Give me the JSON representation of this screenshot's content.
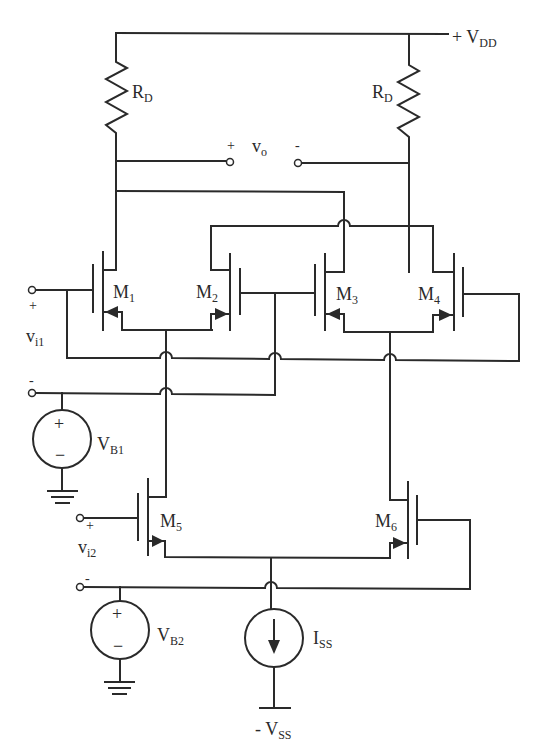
{
  "diagram": {
    "supply": {
      "vdd": {
        "sign": "+",
        "name": "V",
        "sub": "DD"
      },
      "vss": {
        "sign": "-",
        "name": "V",
        "sub": "SS"
      }
    },
    "resistors": [
      {
        "id": "rd-left",
        "name": "R",
        "sub": "D"
      },
      {
        "id": "rd-right",
        "name": "R",
        "sub": "D"
      }
    ],
    "output": {
      "plus": "+",
      "name": "v",
      "sub": "o",
      "minus": "-"
    },
    "transistors": [
      {
        "id": "m1",
        "name": "M",
        "sub": "1"
      },
      {
        "id": "m2",
        "name": "M",
        "sub": "2"
      },
      {
        "id": "m3",
        "name": "M",
        "sub": "3"
      },
      {
        "id": "m4",
        "name": "M",
        "sub": "4"
      },
      {
        "id": "m5",
        "name": "M",
        "sub": "5"
      },
      {
        "id": "m6",
        "name": "M",
        "sub": "6"
      }
    ],
    "inputs": {
      "vi1": {
        "plus": "+",
        "name": "v",
        "sub": "i1",
        "minus": "-"
      },
      "vi2": {
        "plus": "+",
        "name": "v",
        "sub": "i2",
        "minus": "-"
      }
    },
    "sources": {
      "vb1": {
        "name": "V",
        "sub": "B1",
        "plus": "+",
        "minus": "−"
      },
      "vb2": {
        "name": "V",
        "sub": "B2",
        "plus": "+",
        "minus": "−"
      },
      "iss": {
        "name": "I",
        "sub": "SS"
      }
    },
    "colors": {
      "ink": "#2a2a2a",
      "background": "#ffffff"
    }
  }
}
